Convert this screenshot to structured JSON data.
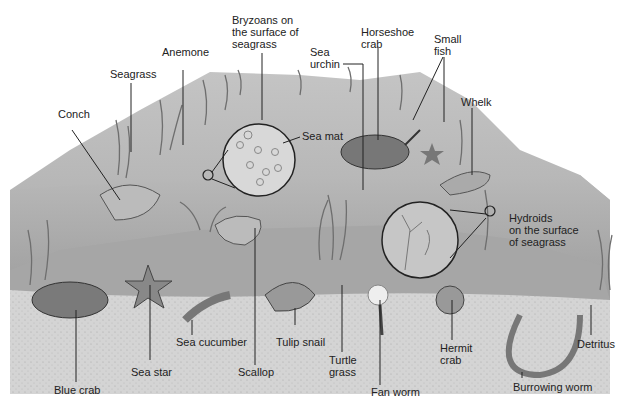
{
  "diagram": {
    "labels": {
      "bryozoans": "Bryzoans on\nthe surface of\nseagrass",
      "anemone": "Anemone",
      "seagrass": "Seagrass",
      "conch": "Conch",
      "sea_mat": "Sea mat",
      "sea_urchin": "Sea\nurchin",
      "horseshoe_crab": "Horseshoe\ncrab",
      "small_fish": "Small\nfish",
      "whelk": "Whelk",
      "hydroids": "Hydroids\non the surface\nof seagrass",
      "blue_crab": "Blue crab",
      "sea_star": "Sea star",
      "sea_cucumber": "Sea cucumber",
      "scallop": "Scallop",
      "tulip_snail": "Tulip snail",
      "turtle_grass": "Turtle\ngrass",
      "fan_worm": "Fan worm",
      "hermit_crab": "Hermit\ncrab",
      "burrowing_worm": "Burrowing worm",
      "detritus": "Detritus"
    },
    "colors": {
      "sky": "#ffffff",
      "mound_top": "#c9c9c9",
      "mound_mid": "#b4b4b4",
      "sand": "#d6d6d6",
      "line": "#222222"
    }
  }
}
